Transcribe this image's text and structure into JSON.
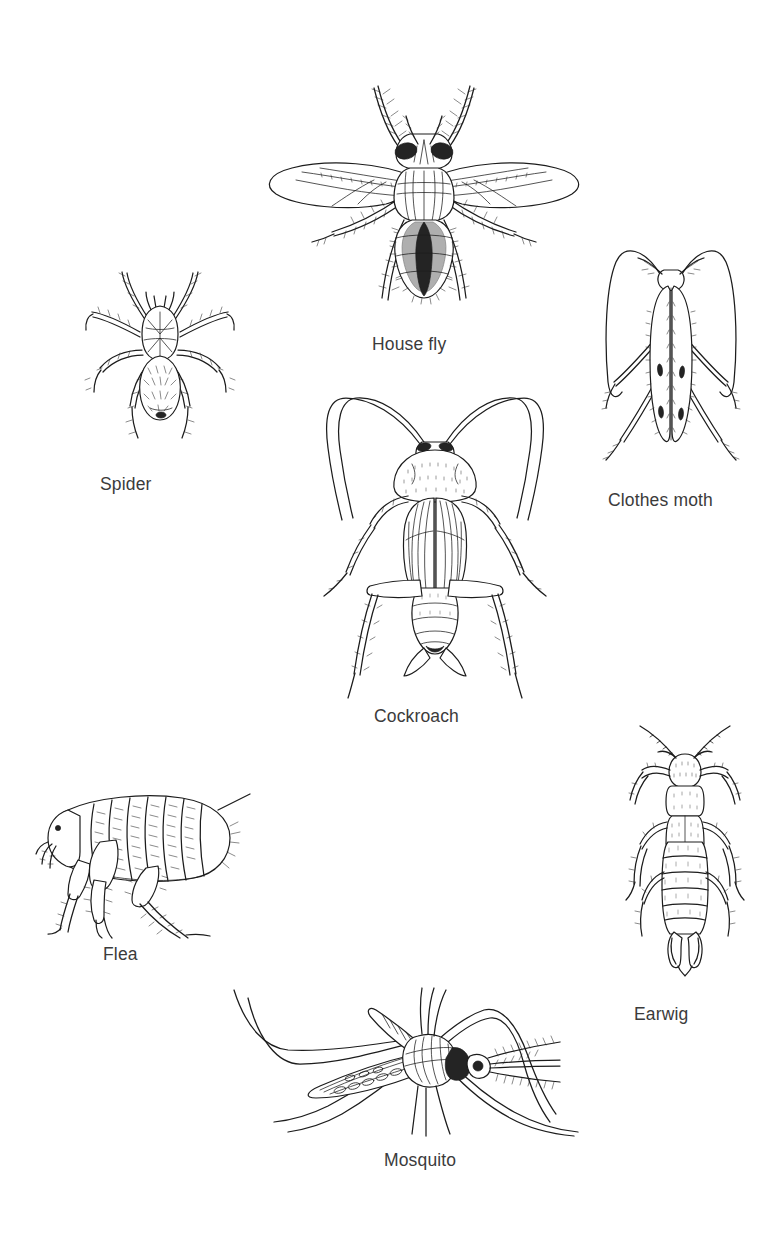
{
  "page": {
    "background_color": "#ffffff",
    "ink_color": "#1c1c1c",
    "caption_color": "#3b3b3b",
    "width": 768,
    "height": 1240
  },
  "specimens": [
    {
      "id": "house-fly",
      "label": "House fly",
      "icon": "house-fly-illustration",
      "caption_x": 372,
      "caption_y": 336,
      "art_x": 262,
      "art_y": 72,
      "art_w": 324,
      "art_h": 242
    },
    {
      "id": "spider",
      "label": "Spider",
      "icon": "spider-illustration",
      "caption_x": 100,
      "caption_y": 476,
      "art_x": 82,
      "art_y": 256,
      "art_w": 156,
      "art_h": 186
    },
    {
      "id": "clothes-moth",
      "label": "Clothes moth",
      "icon": "clothes-moth-illustration",
      "caption_x": 608,
      "caption_y": 492,
      "art_x": 598,
      "art_y": 242,
      "art_w": 146,
      "art_h": 232
    },
    {
      "id": "cockroach",
      "label": "Cockroach",
      "icon": "cockroach-illustration",
      "caption_x": 374,
      "caption_y": 708,
      "art_x": 312,
      "art_y": 392,
      "art_w": 246,
      "art_h": 306
    },
    {
      "id": "flea",
      "label": "Flea",
      "icon": "flea-illustration",
      "caption_x": 103,
      "caption_y": 946,
      "art_x": 34,
      "art_y": 782,
      "art_w": 216,
      "art_h": 156
    },
    {
      "id": "earwig",
      "label": "Earwig",
      "icon": "earwig-illustration",
      "caption_x": 634,
      "caption_y": 1006,
      "art_x": 622,
      "art_y": 722,
      "art_w": 126,
      "art_h": 256
    },
    {
      "id": "mosquito",
      "label": "Mosquito",
      "icon": "mosquito-illustration",
      "caption_x": 384,
      "caption_y": 1152,
      "art_x": 204,
      "art_y": 982,
      "art_w": 392,
      "art_h": 156
    }
  ]
}
